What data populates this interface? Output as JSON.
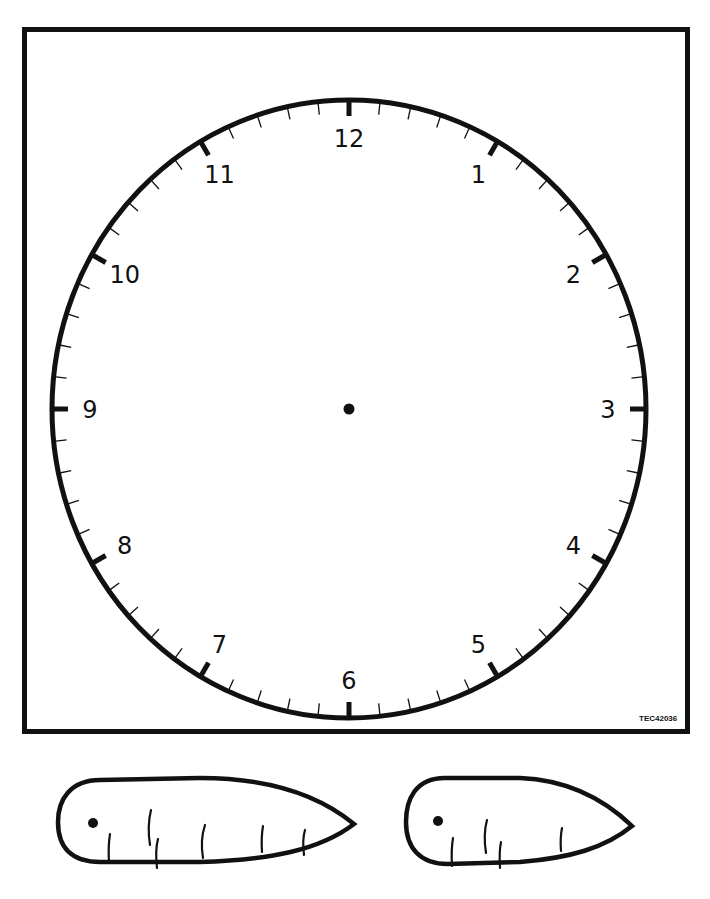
{
  "worksheet": {
    "code_label": "TEC42036",
    "colors": {
      "ink": "#111111",
      "paper": "#ffffff"
    }
  },
  "clock": {
    "center": [
      349,
      409
    ],
    "radius_x": 297,
    "radius_y": 309,
    "numerals": [
      "12",
      "1",
      "2",
      "3",
      "4",
      "5",
      "6",
      "7",
      "8",
      "9",
      "10",
      "11"
    ],
    "minute_ticks": 60,
    "hour_ticks": 12,
    "center_pivot": "pivot-dot"
  },
  "hands": [
    {
      "name": "minute-hand-cutout",
      "type": "long",
      "pivot": "hole-dot",
      "lines": 6
    },
    {
      "name": "hour-hand-cutout",
      "type": "short",
      "pivot": "hole-dot",
      "lines": 4
    }
  ]
}
